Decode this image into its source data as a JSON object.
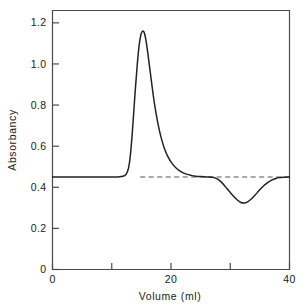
{
  "chart_data": {
    "type": "line",
    "title": "",
    "subtitle": "",
    "xlabel": "Volume (ml)",
    "ylabel": "Absorbancy",
    "xlim": [
      0,
      40
    ],
    "ylim": [
      0,
      1.26
    ],
    "grid": false,
    "legend": null,
    "xticks": [
      0,
      10,
      20,
      30,
      40
    ],
    "xtick_labels": [
      "0",
      "",
      "20",
      "",
      "40"
    ],
    "yticks": [
      0,
      0.2,
      0.4,
      0.6,
      0.8,
      1.0,
      1.2
    ],
    "ytick_labels": [
      "0",
      "0.2",
      "0.4",
      "0.6",
      "0.8",
      "1.0",
      "1.2"
    ],
    "baseline_value": 0.45,
    "annotations": [
      {
        "name": "baseline-reference-dashed",
        "style": "dashed",
        "y": 0.45,
        "x_start": 14.8,
        "x_end": 40.0
      }
    ],
    "series": [
      {
        "name": "Absorbancy trace",
        "style": "solid",
        "x": [
          0.0,
          2.0,
          4.0,
          6.0,
          8.0,
          9.5,
          10.5,
          11.3,
          11.9,
          12.4,
          12.8,
          13.1,
          13.4,
          13.7,
          14.0,
          14.3,
          14.6,
          14.9,
          15.2,
          15.5,
          15.8,
          16.1,
          16.5,
          16.9,
          17.3,
          17.8,
          18.3,
          18.9,
          19.5,
          20.2,
          21.0,
          21.8,
          22.6,
          23.4,
          24.2,
          25.0,
          26.0,
          27.0,
          27.8,
          28.5,
          29.2,
          29.9,
          30.6,
          31.2,
          31.8,
          32.4,
          33.0,
          33.6,
          34.2,
          34.9,
          35.6,
          36.3,
          37.0,
          37.7,
          38.3,
          39.0,
          40.0
        ],
        "y": [
          0.45,
          0.45,
          0.45,
          0.45,
          0.45,
          0.45,
          0.45,
          0.451,
          0.454,
          0.462,
          0.49,
          0.545,
          0.64,
          0.76,
          0.885,
          0.995,
          1.085,
          1.14,
          1.16,
          1.15,
          1.11,
          1.05,
          0.96,
          0.87,
          0.79,
          0.71,
          0.645,
          0.588,
          0.548,
          0.515,
          0.49,
          0.474,
          0.464,
          0.458,
          0.454,
          0.452,
          0.45,
          0.449,
          0.441,
          0.425,
          0.402,
          0.378,
          0.355,
          0.338,
          0.326,
          0.324,
          0.33,
          0.344,
          0.362,
          0.385,
          0.406,
          0.423,
          0.435,
          0.443,
          0.447,
          0.449,
          0.45
        ]
      }
    ]
  }
}
